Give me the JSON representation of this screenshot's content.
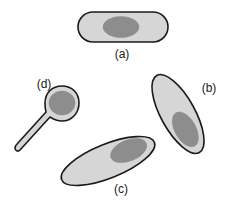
{
  "figure": {
    "kind": "scientific-line-drawing",
    "background_color": "#ffffff",
    "outline_color": "#1a1a1a",
    "body_fill_color": "#d6d6d6",
    "nucleus_fill_color": "#8d8d8d",
    "label_color": "#1a1a1a"
  },
  "shapes": [
    {
      "id": "a",
      "label": "(a)",
      "description": "horizontal rod-shaped cell with central oval nucleus",
      "label_x": 122,
      "label_y": 55
    },
    {
      "id": "b",
      "label": "(b)",
      "description": "elongated spindle cell inclined steeply downward to the right with nucleus near lower end",
      "label_x": 209,
      "label_y": 89
    },
    {
      "id": "c",
      "label": "(c)",
      "description": "elongated spindle cell inclined gently upward to the right with nucleus near upper right end",
      "label_x": 121,
      "label_y": 190
    },
    {
      "id": "d",
      "label": "(d)",
      "description": "tadpole shaped cell with rounded head and tapering tail toward lower left",
      "label_x": 44,
      "label_y": 85
    }
  ]
}
